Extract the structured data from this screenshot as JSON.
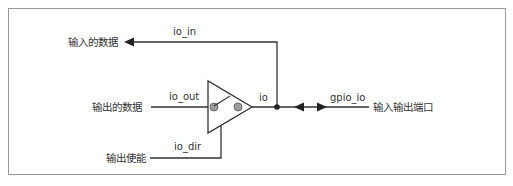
{
  "diagram": {
    "type": "bidirectional-io-buffer",
    "colors": {
      "line": "#333333",
      "frame": "#9a9a9a",
      "circle_fill": "#9c9c9c",
      "text": "#333333"
    },
    "labels": {
      "input_data": "输入的数据",
      "output_data": "输出的数据",
      "output_enable": "输出使能",
      "io_port": "输入输出端口"
    },
    "signals": {
      "io_in": "io_in",
      "io_out": "io_out",
      "io_dir": "io_dir",
      "io": "io",
      "gpio_io": "gpio_io"
    }
  }
}
